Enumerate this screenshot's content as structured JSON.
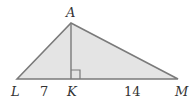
{
  "diagram": {
    "points": {
      "A": {
        "label": "A",
        "x": 71,
        "y": 23
      },
      "L": {
        "label": "L",
        "x": 17,
        "y": 79
      },
      "K": {
        "label": "K",
        "x": 71,
        "y": 79
      },
      "M": {
        "label": "M",
        "x": 178,
        "y": 79
      }
    },
    "segments": [
      {
        "from": "L",
        "to": "K",
        "length_label": "7"
      },
      {
        "from": "K",
        "to": "M",
        "length_label": "14"
      },
      {
        "from": "A",
        "to": "K",
        "note": "altitude, perpendicular to LM"
      }
    ],
    "right_angle_at": "K",
    "colors": {
      "fill": "#e4e4e4",
      "stroke": "#7a7a7a",
      "text": "#333333"
    }
  }
}
